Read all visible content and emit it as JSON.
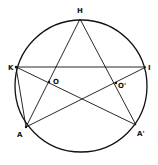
{
  "diagram": {
    "type": "geometry",
    "circle": {
      "cx": 81,
      "cy": 86,
      "r": 66
    },
    "points": [
      {
        "name": "H",
        "x": 80,
        "y": 19,
        "label": "H",
        "lx": 77,
        "ly": 13
      },
      {
        "name": "K",
        "x": 16,
        "y": 67,
        "label": "K",
        "lx": 8,
        "ly": 70
      },
      {
        "name": "I",
        "x": 146,
        "y": 67,
        "label": "I",
        "lx": 148,
        "ly": 70
      },
      {
        "name": "A",
        "x": 26,
        "y": 127,
        "label": "A",
        "lx": 17,
        "ly": 137
      },
      {
        "name": "A'",
        "x": 136,
        "y": 125,
        "label": "A'",
        "lx": 137,
        "ly": 136
      },
      {
        "name": "O",
        "x": 49,
        "y": 82,
        "label": "O",
        "lx": 53,
        "ly": 84
      },
      {
        "name": "O'",
        "x": 116,
        "y": 83,
        "label": "O'",
        "lx": 118,
        "ly": 88
      }
    ],
    "segments": [
      [
        "H",
        "A"
      ],
      [
        "H",
        "A'"
      ],
      [
        "K",
        "I"
      ],
      [
        "K",
        "A"
      ],
      [
        "K",
        "A'"
      ],
      [
        "A",
        "I"
      ]
    ],
    "stroke_color": "#111111"
  }
}
